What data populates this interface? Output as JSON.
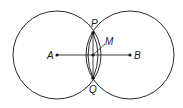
{
  "diagram": {
    "type": "geometric-construction",
    "stroke_color": "#2a2a2a",
    "points": {
      "A": {
        "label": "A",
        "x": 57,
        "y": 55
      },
      "B": {
        "label": "B",
        "x": 130,
        "y": 55
      },
      "P": {
        "label": "P",
        "x": 93,
        "y": 33
      },
      "Q": {
        "label": "Q",
        "x": 93,
        "y": 78
      },
      "M": {
        "label": "M",
        "x": 93,
        "y": 55
      }
    },
    "circles": [
      {
        "name": "circle-A",
        "cx": 57,
        "cy": 55,
        "r": 44
      },
      {
        "name": "circle-B",
        "cx": 130,
        "cy": 55,
        "r": 44
      }
    ],
    "segments": [
      {
        "name": "segment-AB",
        "from": "A",
        "to": "B"
      }
    ],
    "labels": {
      "A": "A",
      "B": "B",
      "P": "P",
      "Q": "Q",
      "M": "M"
    }
  }
}
